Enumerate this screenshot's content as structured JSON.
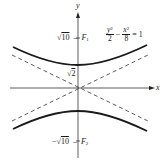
{
  "diagram": {
    "type": "hyperbola",
    "equation": {
      "term1_num_var": "y",
      "term1_num_exp": "2",
      "term1_den": "2",
      "minus": "−",
      "term2_num_var": "x",
      "term2_num_exp": "2",
      "term2_den": "8",
      "equals": "= 1"
    },
    "axes": {
      "x_label": "x",
      "y_label": "y"
    },
    "labels": {
      "focus_upper_value": "10",
      "focus_upper_dash": "–",
      "focus_upper_name": "F",
      "focus_upper_sub": "1",
      "vertex_upper_value": "2",
      "focus_lower_neg": "−",
      "focus_lower_value": "10",
      "focus_lower_dash": "–",
      "focus_lower_name": "F",
      "focus_lower_sub": "2",
      "sqrt_symbol": "√"
    },
    "colors": {
      "curve": "#1a1a1a",
      "asymptote": "#333333",
      "axis": "#333333"
    }
  }
}
